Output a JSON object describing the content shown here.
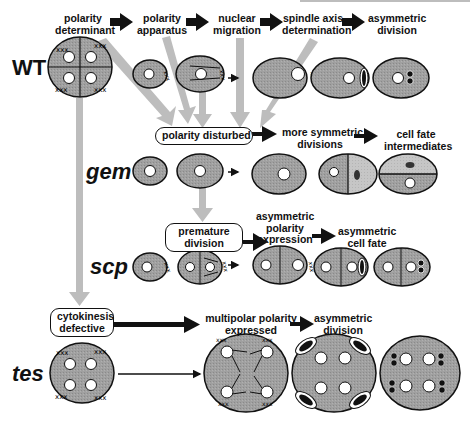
{
  "rows": {
    "wt": "WT",
    "gem": "gem",
    "scp": "scp",
    "tes": "tes"
  },
  "wt_steps": [
    {
      "line1": "polarity",
      "line2": "determinant"
    },
    {
      "line1": "polarity",
      "line2": "apparatus"
    },
    {
      "line1": "nuclear",
      "line2": "migration"
    },
    {
      "line1": "spindle axis",
      "line2": "determination"
    },
    {
      "line1": "asymmetric",
      "line2": "division"
    }
  ],
  "gem": {
    "box": "polarity disturbed",
    "steps": [
      {
        "line1": "more symmetric",
        "line2": "divisions"
      },
      {
        "line1": "cell fate",
        "line2": "intermediates"
      }
    ]
  },
  "scp": {
    "box_line1": "premature",
    "box_line2": "division",
    "steps": [
      {
        "line1": "asymmetric",
        "line2": "polarity",
        "line3": "expression"
      },
      {
        "line1": "asymmetric",
        "line2": "cell fate"
      }
    ]
  },
  "tes": {
    "box_line1": "cytokinesis",
    "box_line2": "defective",
    "steps": [
      {
        "line1": "multipolar polarity",
        "line2": "expressed"
      },
      {
        "line1": "asymmetric",
        "line2": "division"
      }
    ]
  },
  "colors": {
    "cell_fill": "#9a9a9a",
    "cell_light": "#c8c8c8",
    "gray_arrow": "#bcbcbc",
    "black": "#111111",
    "nucleus": "#ffffff"
  }
}
